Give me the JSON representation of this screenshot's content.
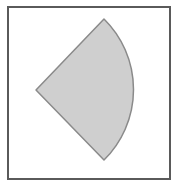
{
  "figure": {
    "frame": {
      "x": 8,
      "y": 7,
      "width": 162,
      "height": 172,
      "stroke": "#5a5a5a",
      "stroke_width": 2
    },
    "sector": {
      "center": {
        "x": 36,
        "y": 90
      },
      "radius": 99,
      "start_point": {
        "x": 104,
        "y": 19
      },
      "end_point": {
        "x": 104,
        "y": 160
      },
      "central_angle_deg": 92,
      "fill": "#cfcfcf",
      "stroke": "#8a8a8a"
    }
  }
}
